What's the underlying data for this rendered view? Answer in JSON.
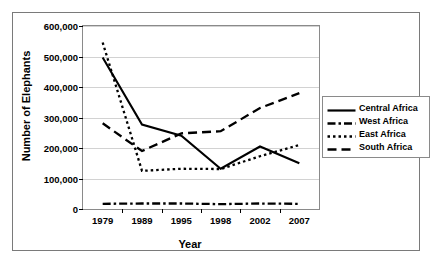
{
  "chart_data": {
    "type": "line",
    "title": "",
    "xlabel": "Year",
    "ylabel": "Number of Elephants",
    "categories": [
      "1979",
      "1989",
      "1995",
      "1998",
      "2002",
      "2007"
    ],
    "ylim": [
      0,
      600000
    ],
    "yticks": [
      0,
      100000,
      200000,
      300000,
      400000,
      500000,
      600000
    ],
    "ytick_labels": [
      "0",
      "100,000",
      "200,000",
      "300,000",
      "400,000",
      "500,000",
      "600,000"
    ],
    "grid": true,
    "legend_position": "right",
    "series": [
      {
        "name": "Central Africa",
        "style": "solid",
        "color": "#000000",
        "values": [
          497000,
          277000,
          240000,
          132000,
          205000,
          150000
        ]
      },
      {
        "name": "West Africa",
        "style": "dash-dot",
        "color": "#000000",
        "values": [
          17000,
          18000,
          18000,
          16000,
          18000,
          17000
        ]
      },
      {
        "name": "East Africa",
        "style": "dotted",
        "color": "#000000",
        "values": [
          546000,
          125000,
          132000,
          131000,
          173000,
          210000
        ]
      },
      {
        "name": "South Africa",
        "style": "dashed",
        "color": "#000000",
        "values": [
          281000,
          190000,
          248000,
          255000,
          331000,
          380000
        ]
      }
    ]
  },
  "legend": {
    "items": [
      {
        "label": "Central Africa",
        "swatch": "solid-line-swatch"
      },
      {
        "label": "West Africa",
        "swatch": "dash-dot-line-swatch"
      },
      {
        "label": "East Africa",
        "swatch": "dotted-line-swatch"
      },
      {
        "label": "South Africa",
        "swatch": "dashed-line-swatch"
      }
    ]
  }
}
